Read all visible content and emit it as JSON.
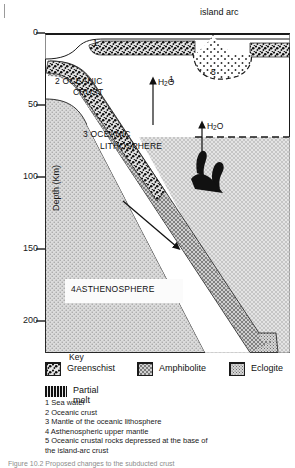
{
  "figure": {
    "kind": "subduction-zone-cross-section",
    "axis": {
      "title": "Depth (Km)",
      "ticks": [
        "0",
        "50",
        "100",
        "150",
        "200"
      ],
      "tick_values": [
        0,
        50,
        100,
        150,
        200
      ],
      "unit": "Km"
    },
    "annotations": {
      "island_arc": "island arc",
      "oceanic_crust": "2 OCEANIC\nCRUST",
      "oceanic_crust_line1": "2 OCEANIC",
      "oceanic_crust_line2": "CRUST",
      "oceanic_lithosphere_line1": "3 OCEANIC",
      "oceanic_lithosphere_line2": "LITHOSPHERE",
      "asthenosphere": "4ASTHENOSPHERE",
      "water_upper": "H2O",
      "water_lower": "H2O",
      "sea_water_marker_top": "1",
      "sea_water_marker_mid": "1",
      "depressed_crust_marker": "5"
    }
  },
  "key": {
    "title": "Key",
    "items": [
      {
        "label": "Greenschist",
        "pattern": "greenschist"
      },
      {
        "label": "Amphibolite",
        "pattern": "amphibolite"
      },
      {
        "label": "Eclogite",
        "pattern": "eclogite"
      }
    ],
    "melt": {
      "label": "Partial melt",
      "pattern": "partial-melt"
    }
  },
  "notes": [
    "1 Sea water",
    "2 Oceanic crust",
    "3 Mantle of the oceanic lithosphere",
    "4 Asthenospheric upper mantle",
    "5 Oceanic crustal rocks depressed at the base of",
    "the island-arc crust"
  ],
  "caption": "Figure    10.2  Proposed changes to the subducted crust",
  "colors": {
    "ink": "#1a1a1a",
    "melt": "#111111",
    "asthenosphere_fill": "#d8d8d8",
    "lithosphere_fill": "#c9c9c9",
    "background": "#ffffff"
  }
}
